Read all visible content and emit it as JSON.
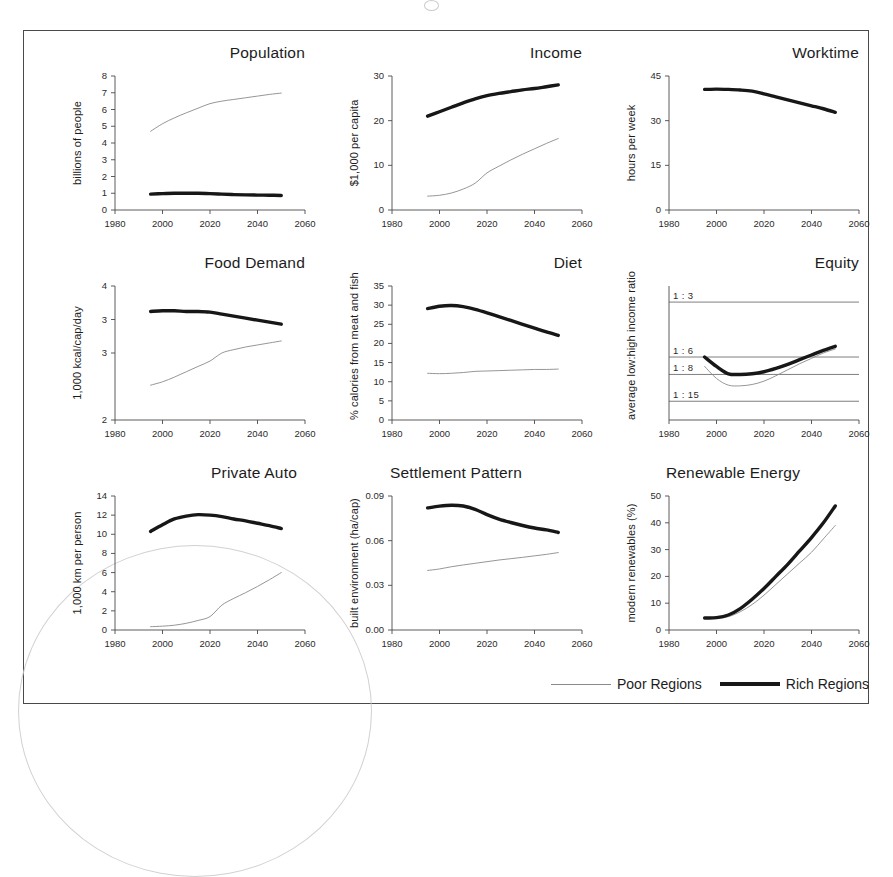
{
  "legend": {
    "poor_label": "Poor Regions",
    "rich_label": "Rich Regions",
    "poor_color": "#8a8a8a",
    "rich_color": "#171717"
  },
  "axis": {
    "x_ticks": [
      "1980",
      "2000",
      "2020",
      "2040",
      "2060"
    ],
    "x_min": 1980,
    "x_max": 2060
  },
  "chart_data": [
    {
      "type": "line",
      "title": "Population",
      "ylabel": "billions of people",
      "xlabel": "",
      "xlim": [
        1980,
        2060
      ],
      "ylim": [
        0,
        8
      ],
      "y_ticks": [
        "0",
        "1",
        "2",
        "3",
        "4",
        "5",
        "6",
        "7",
        "8"
      ],
      "y_tick_values": [
        0,
        1,
        2,
        3,
        4,
        5,
        6,
        7,
        8
      ],
      "grid": false,
      "x": [
        1995,
        2000,
        2005,
        2010,
        2015,
        2020,
        2025,
        2030,
        2035,
        2040,
        2045,
        2050
      ],
      "series": [
        {
          "name": "Poor Regions",
          "style": "thin",
          "values": [
            4.7,
            5.15,
            5.5,
            5.8,
            6.08,
            6.35,
            6.5,
            6.6,
            6.7,
            6.8,
            6.9,
            6.98
          ]
        },
        {
          "name": "Rich Regions",
          "style": "thick",
          "values": [
            0.95,
            0.98,
            1.0,
            1.0,
            1.0,
            0.98,
            0.95,
            0.92,
            0.9,
            0.89,
            0.88,
            0.87
          ]
        }
      ]
    },
    {
      "type": "line",
      "title": "Income",
      "ylabel": "$1,000 per capita",
      "xlabel": "",
      "xlim": [
        1980,
        2060
      ],
      "ylim": [
        0,
        30
      ],
      "y_ticks": [
        "0",
        "10",
        "20",
        "30"
      ],
      "y_tick_values": [
        0,
        10,
        20,
        30
      ],
      "grid": false,
      "x": [
        1995,
        2000,
        2005,
        2010,
        2015,
        2020,
        2025,
        2030,
        2035,
        2040,
        2045,
        2050
      ],
      "series": [
        {
          "name": "Poor Regions",
          "style": "thin",
          "values": [
            3.1,
            3.3,
            3.8,
            4.7,
            6.0,
            8.3,
            9.8,
            11.2,
            12.5,
            13.7,
            14.9,
            16.0
          ]
        },
        {
          "name": "Rich Regions",
          "style": "thick",
          "values": [
            21.0,
            22.0,
            23.0,
            24.0,
            24.9,
            25.6,
            26.1,
            26.5,
            26.9,
            27.2,
            27.6,
            28.0
          ]
        }
      ]
    },
    {
      "type": "line",
      "title": "Worktime",
      "ylabel": "hours per week",
      "xlabel": "",
      "xlim": [
        1980,
        2060
      ],
      "ylim": [
        0,
        45
      ],
      "y_ticks": [
        "0",
        "15",
        "30",
        "45"
      ],
      "y_tick_values": [
        0,
        15,
        30,
        45
      ],
      "grid": false,
      "x": [
        1995,
        2000,
        2005,
        2010,
        2015,
        2020,
        2025,
        2030,
        2035,
        2040,
        2045,
        2050
      ],
      "series": [
        {
          "name": "Rich Regions",
          "style": "thick",
          "values": [
            40.5,
            40.6,
            40.5,
            40.3,
            39.9,
            39.0,
            38.0,
            37.0,
            36.0,
            35.0,
            34.0,
            32.8
          ]
        }
      ]
    },
    {
      "type": "line",
      "title": "Food Demand",
      "ylabel": "1,000 kcal/cap/day",
      "xlabel": "",
      "xlim": [
        1980,
        2060
      ],
      "ylim": [
        2,
        4
      ],
      "y_ticks": [
        "4",
        "3",
        "3",
        "2"
      ],
      "y_tick_values": [
        4,
        3.5,
        3,
        2
      ],
      "grid": false,
      "x": [
        1995,
        2000,
        2005,
        2010,
        2015,
        2020,
        2025,
        2030,
        2035,
        2040,
        2045,
        2050
      ],
      "series": [
        {
          "name": "Poor Regions",
          "style": "thin",
          "values": [
            2.52,
            2.57,
            2.64,
            2.72,
            2.8,
            2.88,
            3.0,
            3.05,
            3.09,
            3.12,
            3.15,
            3.18
          ]
        },
        {
          "name": "Rich Regions",
          "style": "thick",
          "values": [
            3.62,
            3.63,
            3.63,
            3.62,
            3.62,
            3.61,
            3.58,
            3.55,
            3.52,
            3.49,
            3.46,
            3.43
          ]
        }
      ]
    },
    {
      "type": "line",
      "title": "Diet",
      "ylabel": "% calories from meat and fish",
      "xlabel": "",
      "xlim": [
        1980,
        2060
      ],
      "ylim": [
        0,
        35
      ],
      "y_ticks": [
        "0",
        "5",
        "10",
        "15",
        "20",
        "25",
        "30",
        "35"
      ],
      "y_tick_values": [
        0,
        5,
        10,
        15,
        20,
        25,
        30,
        35
      ],
      "grid": false,
      "x": [
        1995,
        2000,
        2005,
        2010,
        2015,
        2020,
        2025,
        2030,
        2035,
        2040,
        2045,
        2050
      ],
      "series": [
        {
          "name": "Poor Regions",
          "style": "thin",
          "values": [
            12.2,
            12.1,
            12.2,
            12.4,
            12.7,
            12.8,
            12.9,
            13.0,
            13.1,
            13.2,
            13.2,
            13.3
          ]
        },
        {
          "name": "Rich Regions",
          "style": "thick",
          "values": [
            29.1,
            29.7,
            29.9,
            29.6,
            28.9,
            28.0,
            27.0,
            26.0,
            25.0,
            24.0,
            23.0,
            22.1
          ]
        }
      ]
    },
    {
      "type": "line",
      "title": "Equity",
      "ylabel": "average low:high income ratio",
      "xlabel": "",
      "xlim": [
        1980,
        2060
      ],
      "ylim": [
        0,
        100
      ],
      "y_ticks": [],
      "y_tick_values": [],
      "grid": true,
      "gridlines": [
        {
          "label": "1 : 3",
          "pos": 88
        },
        {
          "label": "1 : 6",
          "pos": 47
        },
        {
          "label": "1 : 8",
          "pos": 34
        },
        {
          "label": "1 : 15",
          "pos": 14
        }
      ],
      "x": [
        1995,
        2000,
        2005,
        2010,
        2015,
        2020,
        2025,
        2030,
        2035,
        2040,
        2045,
        2050
      ],
      "series": [
        {
          "name": "Poor Regions",
          "style": "thin",
          "values": [
            40.0,
            31.0,
            26.0,
            25.5,
            26.5,
            29.0,
            33.0,
            37.5,
            42.0,
            46.0,
            50.0,
            53.0
          ]
        },
        {
          "name": "Rich Regions",
          "style": "thick",
          "values": [
            47.0,
            40.0,
            34.5,
            34.0,
            34.5,
            36.0,
            38.5,
            41.5,
            45.0,
            48.5,
            52.0,
            55.0
          ]
        }
      ]
    },
    {
      "type": "line",
      "title": "Private Auto",
      "ylabel": "1,000 km per person",
      "xlabel": "",
      "xlim": [
        1980,
        2060
      ],
      "ylim": [
        0,
        14
      ],
      "y_ticks": [
        "0",
        "2",
        "4",
        "6",
        "8",
        "10",
        "12",
        "14"
      ],
      "y_tick_values": [
        0,
        2,
        4,
        6,
        8,
        10,
        12,
        14
      ],
      "grid": false,
      "x": [
        1995,
        2000,
        2005,
        2010,
        2015,
        2020,
        2025,
        2030,
        2035,
        2040,
        2045,
        2050
      ],
      "series": [
        {
          "name": "Poor Regions",
          "style": "thin",
          "values": [
            0.35,
            0.4,
            0.5,
            0.7,
            1.0,
            1.4,
            2.6,
            3.3,
            3.9,
            4.55,
            5.25,
            6.0
          ]
        },
        {
          "name": "Rich Regions",
          "style": "thick",
          "values": [
            10.3,
            11.0,
            11.6,
            11.9,
            12.05,
            12.0,
            11.85,
            11.6,
            11.4,
            11.15,
            10.9,
            10.6
          ]
        }
      ]
    },
    {
      "type": "line",
      "title": "Settlement Pattern",
      "ylabel": "built environment (ha/cap)",
      "xlabel": "",
      "xlim": [
        1980,
        2060
      ],
      "ylim": [
        0,
        0.09
      ],
      "y_ticks": [
        "0.00",
        "0.03",
        "0.06",
        "0.09"
      ],
      "y_tick_values": [
        0.0,
        0.03,
        0.06,
        0.09
      ],
      "grid": false,
      "x": [
        1995,
        2000,
        2005,
        2010,
        2015,
        2020,
        2025,
        2030,
        2035,
        2040,
        2045,
        2050
      ],
      "series": [
        {
          "name": "Poor Regions",
          "style": "thin",
          "values": [
            0.04,
            0.041,
            0.0425,
            0.0437,
            0.0448,
            0.0459,
            0.047,
            0.0479,
            0.0488,
            0.0498,
            0.0508,
            0.052
          ]
        },
        {
          "name": "Rich Regions",
          "style": "thick",
          "values": [
            0.082,
            0.0832,
            0.0838,
            0.0833,
            0.081,
            0.0775,
            0.0745,
            0.0722,
            0.0702,
            0.0685,
            0.0672,
            0.0655
          ]
        }
      ]
    },
    {
      "type": "line",
      "title": "Renewable Energy",
      "ylabel": "modern renewables (%)",
      "xlabel": "",
      "xlim": [
        1980,
        2060
      ],
      "ylim": [
        0,
        50
      ],
      "y_ticks": [
        "0",
        "10",
        "20",
        "30",
        "40",
        "50"
      ],
      "y_tick_values": [
        0,
        10,
        20,
        30,
        40,
        50
      ],
      "grid": false,
      "x": [
        1995,
        2000,
        2005,
        2010,
        2015,
        2020,
        2025,
        2030,
        2035,
        2040,
        2045,
        2050
      ],
      "series": [
        {
          "name": "Poor Regions",
          "style": "thin",
          "values": [
            4.4,
            4.4,
            5.0,
            6.8,
            9.5,
            13.0,
            17.0,
            21.0,
            25.0,
            29.0,
            34.0,
            39.0
          ]
        },
        {
          "name": "Rich Regions",
          "style": "thick",
          "values": [
            4.5,
            4.6,
            5.6,
            8.0,
            11.5,
            15.5,
            20.0,
            24.5,
            29.5,
            34.5,
            40.0,
            46.3
          ]
        }
      ]
    }
  ]
}
